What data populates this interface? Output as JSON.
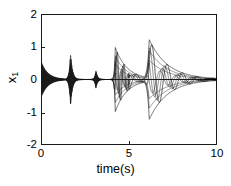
{
  "chart_data": {
    "type": "line",
    "title": "",
    "xlabel": "time(s)",
    "ylabel": "x_1",
    "ylabel_base": "x",
    "ylabel_sub": "1",
    "xlim": [
      0,
      10
    ],
    "ylim": [
      -2,
      2
    ],
    "xticks": [
      0,
      5,
      10
    ],
    "xtick_labels": [
      "0",
      "5",
      "10"
    ],
    "yticks": [
      -2,
      -1,
      0,
      1,
      2
    ],
    "ytick_labels": [
      "-2",
      "-1",
      "0",
      "1",
      "2"
    ],
    "grid": false,
    "legend": false,
    "line_color": "#1a1a1a",
    "background": "#ffffff",
    "axis_color": "#1a1a1a",
    "bursts": [
      {
        "t_center": 0.0,
        "peak_amplitude": 0.55,
        "frequency": 22,
        "decay": 2.6,
        "rise": 0.0
      },
      {
        "t_center": 1.68,
        "peak_amplitude": 0.76,
        "frequency": 30,
        "decay": 9.0,
        "rise": 14.0
      },
      {
        "t_center": 3.12,
        "peak_amplitude": 0.27,
        "frequency": 26,
        "decay": 11.0,
        "rise": 16.0
      },
      {
        "t_center": 4.22,
        "peak_amplitude": 0.98,
        "frequency": 3.0,
        "decay": 1.5,
        "rise": 22.0
      },
      {
        "t_center": 6.15,
        "peak_amplitude": 1.22,
        "frequency": 1.25,
        "decay": 0.95,
        "rise": 10.0
      }
    ],
    "series": [
      {
        "name": "x_1",
        "x": [
          0.0,
          0.1,
          0.2,
          0.3,
          0.4,
          0.5,
          0.6,
          0.7,
          0.8,
          0.9,
          1.0,
          1.1,
          1.2,
          1.3,
          1.4,
          1.5,
          1.6,
          1.7,
          1.8,
          1.9,
          2.0,
          2.2,
          2.4,
          2.6,
          2.8,
          3.0,
          3.1,
          3.2,
          3.4,
          3.6,
          3.8,
          4.0,
          4.1,
          4.2,
          4.3,
          4.5,
          4.8,
          5.0,
          5.3,
          5.6,
          5.9,
          6.1,
          6.3,
          6.6,
          6.9,
          7.0,
          7.3,
          7.6,
          8.0,
          8.5,
          9.0,
          9.5,
          10.0
        ],
        "envelope_upper": [
          0.55,
          0.52,
          0.47,
          0.42,
          0.36,
          0.31,
          0.27,
          0.24,
          0.24,
          0.3,
          0.42,
          0.55,
          0.64,
          0.7,
          0.74,
          0.76,
          0.74,
          0.68,
          0.55,
          0.4,
          0.28,
          0.16,
          0.11,
          0.1,
          0.15,
          0.25,
          0.27,
          0.24,
          0.16,
          0.11,
          0.1,
          0.3,
          0.62,
          0.98,
          0.8,
          0.48,
          0.26,
          0.2,
          0.16,
          0.3,
          0.95,
          1.2,
          1.15,
          0.88,
          0.7,
          0.72,
          0.48,
          0.3,
          0.15,
          0.06,
          0.02,
          0.01,
          0.0
        ],
        "envelope_lower": [
          -0.55,
          -0.52,
          -0.47,
          -0.42,
          -0.36,
          -0.31,
          -0.27,
          -0.24,
          -0.24,
          -0.3,
          -0.42,
          -0.55,
          -0.64,
          -0.7,
          -0.74,
          -0.76,
          -0.74,
          -0.68,
          -0.55,
          -0.4,
          -0.28,
          -0.16,
          -0.11,
          -0.1,
          -0.15,
          -0.25,
          -0.27,
          -0.24,
          -0.16,
          -0.11,
          -0.1,
          -0.3,
          -0.62,
          -0.98,
          -0.8,
          -0.48,
          -0.26,
          -0.2,
          -0.16,
          -0.3,
          -0.95,
          -1.2,
          -1.15,
          -0.88,
          -0.7,
          -0.72,
          -0.48,
          -0.3,
          -0.15,
          -0.06,
          -0.02,
          -0.01,
          0.0
        ]
      }
    ]
  },
  "axis": {
    "xlabel": "time(s)",
    "xtick_labels": [
      "0",
      "5",
      "10"
    ],
    "ytick_labels": [
      "2",
      "1",
      "0",
      "-1",
      "-2"
    ]
  }
}
